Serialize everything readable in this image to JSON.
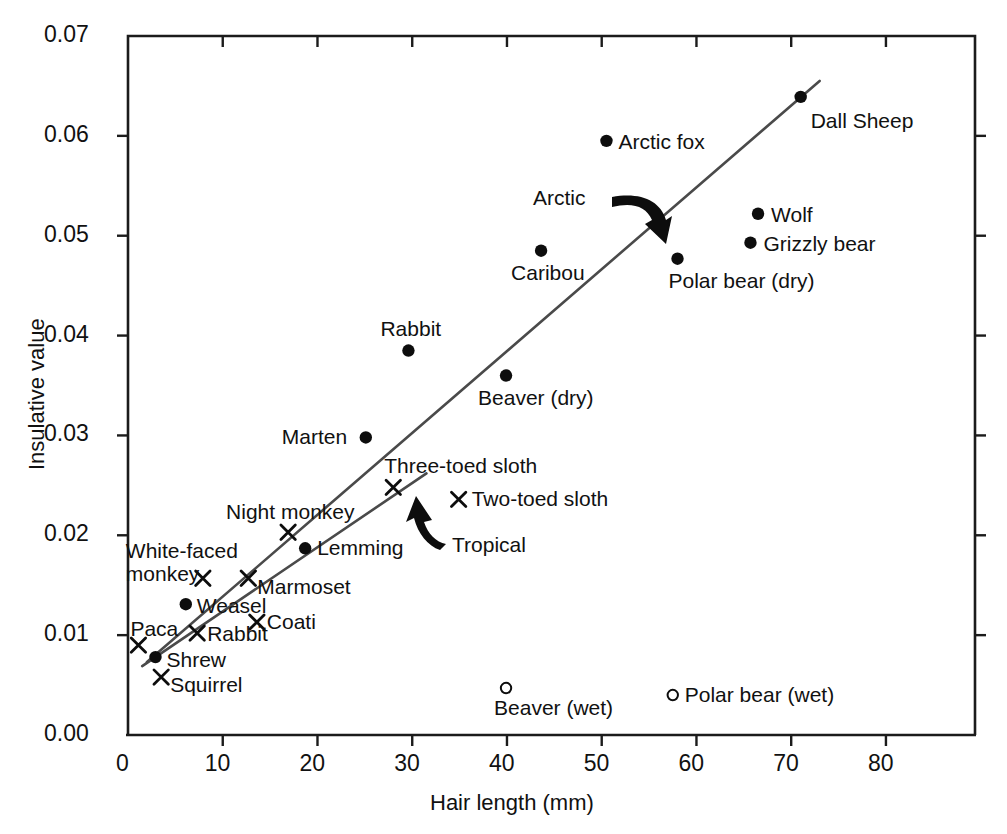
{
  "chart_data": {
    "type": "scatter",
    "title": "",
    "xlabel": "Hair length (mm)",
    "ylabel": "Insulative value",
    "xlim": [
      0,
      89.4
    ],
    "ylim": [
      0.0,
      0.07
    ],
    "xticks": [
      "0",
      "10",
      "20",
      "30",
      "40",
      "50",
      "60",
      "70",
      "80"
    ],
    "xtick_values": [
      0,
      10,
      20,
      30,
      40,
      50,
      60,
      70,
      80
    ],
    "yticks": [
      "0.00",
      "0.01",
      "0.02",
      "0.03",
      "0.04",
      "0.05",
      "0.06",
      "0.07"
    ],
    "ytick_values": [
      0.0,
      0.01,
      0.02,
      0.03,
      0.04,
      0.05,
      0.06,
      0.07
    ],
    "grid": false,
    "legend": "none",
    "marker_styles": {
      "filled-circle": "Arctic / temperate mammal (dry)",
      "cross": "Tropical mammal",
      "open-circle": "Wet fur"
    },
    "series": [
      {
        "name": "Arctic",
        "marker": "filled-circle",
        "points": [
          {
            "label": "Dall Sheep",
            "x": 71.0,
            "y": 0.0639,
            "label_pos": "below-right"
          },
          {
            "label": "Arctic fox",
            "x": 50.5,
            "y": 0.0595,
            "label_pos": "right"
          },
          {
            "label": "Wolf",
            "x": 66.5,
            "y": 0.0522,
            "label_pos": "right"
          },
          {
            "label": "Grizzly bear",
            "x": 65.7,
            "y": 0.0493,
            "label_pos": "right"
          },
          {
            "label": "Polar bear (dry)",
            "x": 58.0,
            "y": 0.0477,
            "label_pos": "below-right"
          },
          {
            "label": "Caribou",
            "x": 43.6,
            "y": 0.0485,
            "label_pos": "below-left"
          },
          {
            "label": "Rabbit",
            "x": 29.6,
            "y": 0.0385,
            "label_pos": "above"
          },
          {
            "label": "Beaver (dry)",
            "x": 39.9,
            "y": 0.036,
            "label_pos": "below"
          },
          {
            "label": "Marten",
            "x": 25.1,
            "y": 0.0298,
            "label_pos": "left"
          },
          {
            "label": "Lemming",
            "x": 18.7,
            "y": 0.0187,
            "label_pos": "right"
          },
          {
            "label": "Weasel",
            "x": 6.1,
            "y": 0.0131,
            "label_pos": "right"
          },
          {
            "label": "Shrew",
            "x": 2.9,
            "y": 0.0078,
            "label_pos": "right"
          }
        ]
      },
      {
        "name": "Tropical",
        "marker": "cross",
        "points": [
          {
            "label": "Two-toed sloth",
            "x": 34.9,
            "y": 0.0236,
            "label_pos": "right"
          },
          {
            "label": "Three-toed sloth",
            "x": 28.0,
            "y": 0.0248,
            "label_pos": "above-right"
          },
          {
            "label": "Night monkey",
            "x": 16.9,
            "y": 0.0203,
            "label_pos": "above"
          },
          {
            "label": "White-faced monkey",
            "x": 7.9,
            "y": 0.0157,
            "label_pos": "left"
          },
          {
            "label": "Marmoset",
            "x": 12.7,
            "y": 0.0157,
            "label_pos": "right"
          },
          {
            "label": "Coati",
            "x": 13.6,
            "y": 0.0113,
            "label_pos": "right"
          },
          {
            "label": "Rabbit",
            "x": 7.3,
            "y": 0.0102,
            "label_pos": "right"
          },
          {
            "label": "Paca",
            "x": 1.1,
            "y": 0.009,
            "label_pos": "above"
          },
          {
            "label": "Squirrel",
            "x": 3.5,
            "y": 0.0058,
            "label_pos": "right"
          }
        ]
      },
      {
        "name": "Wet fur",
        "marker": "open-circle",
        "points": [
          {
            "label": "Beaver (wet)",
            "x": 39.9,
            "y": 0.0047,
            "label_pos": "below"
          },
          {
            "label": "Polar bear (wet)",
            "x": 57.5,
            "y": 0.004,
            "label_pos": "right"
          }
        ]
      }
    ],
    "trend_lines": [
      {
        "name": "Arctic",
        "x0": 2.0,
        "y0": 0.0073,
        "x1": 73.0,
        "y1": 0.0655,
        "annotation": "Arctic"
      },
      {
        "name": "Tropical",
        "x0": 1.5,
        "y0": 0.0069,
        "x1": 31.5,
        "y1": 0.0262,
        "annotation": "Tropical"
      }
    ],
    "annotations": [
      {
        "text": "Arctic",
        "x": 44.0,
        "y": 0.055
      },
      {
        "text": "Tropical",
        "x": 31.0,
        "y": 0.0203
      }
    ]
  },
  "axes": {
    "x_title": "Hair length (mm)",
    "y_title": "Insulative value"
  }
}
